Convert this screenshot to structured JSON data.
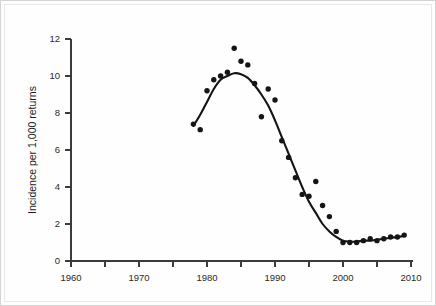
{
  "chart_data": {
    "type": "scatter",
    "title": "",
    "subtitle": "",
    "xlabel": "",
    "ylabel": "Incidence per 1,000 returns",
    "xlim": [
      1957,
      2011
    ],
    "ylim": [
      0,
      12
    ],
    "grid": false,
    "legend": "none",
    "x_ticks": [
      1960,
      1970,
      1980,
      1990,
      2000,
      2010
    ],
    "x_tick_labels": [
      "1960",
      "1970",
      "1980",
      "1990",
      "2000",
      "2010"
    ],
    "x_minor_ticks": [
      1965,
      1975,
      1985,
      1995,
      2005
    ],
    "y_ticks": [
      0,
      2,
      4,
      6,
      8,
      10,
      12
    ],
    "y_tick_labels": [
      "0",
      "2",
      "4",
      "6",
      "8",
      "10",
      "12"
    ],
    "series": [
      {
        "name": "Incidence",
        "type": "scatter",
        "marker": "filled-circle",
        "color": "#151515",
        "x": [
          1978,
          1979,
          1980,
          1981,
          1982,
          1983,
          1984,
          1985,
          1986,
          1987,
          1988,
          1989,
          1990,
          1991,
          1992,
          1993,
          1994,
          1995,
          1996,
          1997,
          1998,
          1999,
          2000,
          2001,
          2002,
          2003,
          2004,
          2005,
          2006,
          2007,
          2008,
          2009
        ],
        "y": [
          7.4,
          7.1,
          9.2,
          9.8,
          10.0,
          10.2,
          11.5,
          10.8,
          10.6,
          9.6,
          7.8,
          9.3,
          8.7,
          6.5,
          5.6,
          4.5,
          3.6,
          3.5,
          4.3,
          3.0,
          2.4,
          1.6,
          1.0,
          1.0,
          1.0,
          1.1,
          1.2,
          1.1,
          1.2,
          1.3,
          1.3,
          1.4
        ]
      },
      {
        "name": "Smoothed trend",
        "type": "line",
        "color": "#141414",
        "x": [
          1978,
          1979,
          1980,
          1981,
          1982,
          1983,
          1984,
          1985,
          1986,
          1987,
          1988,
          1989,
          1990,
          1991,
          1992,
          1993,
          1994,
          1995,
          1996,
          1997,
          1998,
          1999,
          2000,
          2001,
          2002,
          2003,
          2004,
          2005,
          2006,
          2007,
          2008,
          2009
        ],
        "y": [
          7.3,
          7.9,
          8.6,
          9.3,
          9.8,
          10.0,
          10.15,
          10.1,
          9.9,
          9.5,
          9.0,
          8.4,
          7.6,
          6.7,
          5.8,
          4.9,
          4.0,
          3.2,
          2.6,
          2.0,
          1.6,
          1.3,
          1.1,
          1.05,
          1.05,
          1.1,
          1.1,
          1.15,
          1.2,
          1.25,
          1.3,
          1.35
        ]
      }
    ]
  },
  "axis": {
    "y_title": "Incidence per 1,000 returns"
  }
}
